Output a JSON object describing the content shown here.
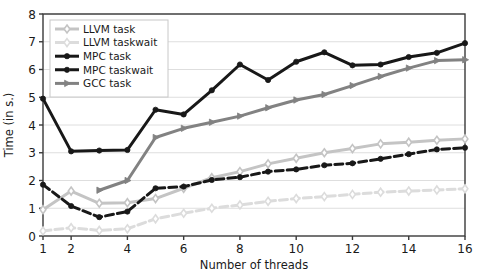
{
  "chart_data": {
    "type": "line",
    "title": "",
    "xlabel": "Number of threads",
    "ylabel": "Time (in s.)",
    "xlim": [
      1,
      16
    ],
    "ylim": [
      0,
      8
    ],
    "xticks": [
      1,
      2,
      4,
      6,
      8,
      10,
      12,
      14,
      16
    ],
    "xticklabels": [
      "1",
      "2",
      "4",
      "6",
      "8",
      "10",
      "12",
      "14",
      "16"
    ],
    "yticks": [
      0,
      1,
      2,
      3,
      4,
      5,
      6,
      7,
      8
    ],
    "yticklabels": [
      "0",
      "1",
      "2",
      "3",
      "4",
      "5",
      "6",
      "7",
      "8"
    ],
    "grid": true,
    "grid_axis": "y",
    "legend_position": "upper left",
    "x": [
      1,
      2,
      3,
      4,
      5,
      6,
      7,
      8,
      9,
      10,
      11,
      12,
      13,
      14,
      15,
      16
    ],
    "series": [
      {
        "name": "LLVM task",
        "color": "#c4c4c4",
        "marker": "diamond-open",
        "linestyle": "solid",
        "x": [
          1,
          2,
          3,
          4,
          5,
          6,
          7,
          8,
          9,
          10,
          11,
          12,
          13,
          14,
          15,
          16
        ],
        "values": [
          0.95,
          1.62,
          1.18,
          1.2,
          1.35,
          1.72,
          2.1,
          2.32,
          2.6,
          2.8,
          3.0,
          3.15,
          3.32,
          3.38,
          3.45,
          3.5
        ]
      },
      {
        "name": "LLVM taskwait",
        "color": "#dcdcdc",
        "marker": "diamond-open",
        "linestyle": "dashed",
        "x": [
          1,
          2,
          3,
          4,
          5,
          6,
          7,
          8,
          9,
          10,
          11,
          12,
          13,
          14,
          15,
          16
        ],
        "values": [
          0.18,
          0.3,
          0.2,
          0.26,
          0.62,
          0.82,
          1.0,
          1.12,
          1.25,
          1.35,
          1.42,
          1.5,
          1.58,
          1.62,
          1.66,
          1.7
        ]
      },
      {
        "name": "MPC task",
        "color": "#181818",
        "marker": "circle-filled",
        "linestyle": "solid",
        "x": [
          1,
          2,
          3,
          4,
          5,
          6,
          7,
          8,
          9,
          10,
          11,
          12,
          13,
          14,
          15,
          16
        ],
        "values": [
          4.95,
          3.05,
          3.08,
          3.1,
          4.55,
          4.38,
          5.25,
          6.18,
          5.62,
          6.28,
          6.62,
          6.15,
          6.18,
          6.45,
          6.6,
          6.95
        ]
      },
      {
        "name": "MPC taskwait",
        "color": "#181818",
        "marker": "circle-filled",
        "linestyle": "dashed",
        "x": [
          1,
          2,
          3,
          4,
          5,
          6,
          7,
          8,
          9,
          10,
          11,
          12,
          13,
          14,
          15,
          16
        ],
        "values": [
          1.85,
          1.08,
          0.68,
          0.88,
          1.72,
          1.78,
          2.02,
          2.12,
          2.32,
          2.4,
          2.55,
          2.62,
          2.78,
          2.95,
          3.12,
          3.18
        ]
      },
      {
        "name": "GCC task",
        "color": "#828282",
        "marker": "triangle-right",
        "linestyle": "solid",
        "x": [
          3,
          4,
          5,
          6,
          7,
          8,
          9,
          10,
          11,
          12,
          13,
          14,
          15,
          16
        ],
        "values": [
          1.65,
          2.0,
          3.55,
          3.88,
          4.1,
          4.32,
          4.62,
          4.9,
          5.1,
          5.42,
          5.75,
          6.05,
          6.32,
          6.35
        ]
      }
    ],
    "legend": [
      {
        "label": "LLVM task",
        "color": "#c4c4c4",
        "marker": "diamond-open",
        "linestyle": "solid"
      },
      {
        "label": "LLVM taskwait",
        "color": "#dcdcdc",
        "marker": "diamond-open",
        "linestyle": "dashed"
      },
      {
        "label": "MPC task",
        "color": "#181818",
        "marker": "circle-filled",
        "linestyle": "solid"
      },
      {
        "label": "MPC taskwait",
        "color": "#181818",
        "marker": "circle-filled",
        "linestyle": "dashed"
      },
      {
        "label": "GCC task",
        "color": "#828282",
        "marker": "triangle-right",
        "linestyle": "solid"
      }
    ]
  }
}
